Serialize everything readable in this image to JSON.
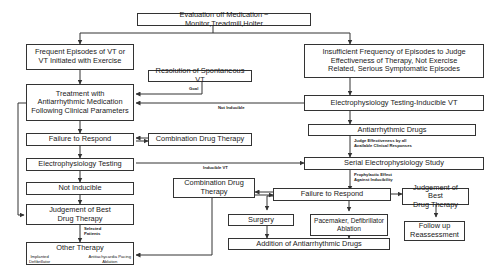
{
  "diagram": {
    "nodes": {
      "evaluation": "Evaluation off Medication ~ Monitor,Treadmill,Holter",
      "frequent_episodes": [
        "Frequent Episodes of VT or",
        "VT Initiated with Exercise"
      ],
      "insufficient_frequency": [
        "Insufficient Frequency of Episodes to Judge",
        "Effectiveness of Therapy, Not Exercise",
        "Related, Serious Symptomatic Episodes"
      ],
      "resolution_spontaneous_vt": "Resolution of Spontaneous VT",
      "treatment_antiarrhythmic": [
        "Treatment with",
        "Antiarrhythmic Medication",
        "Following Clinical Parameters"
      ],
      "ep_testing_inducible": "Electrophysiology Testing-Inducible VT",
      "failure_left": "Failure to Respond",
      "combination_left": "Combination Drug Therapy",
      "antiarrhythmic_drugs": "Antiarrhythmic Drugs",
      "ep_testing_left": "Electrophysiology Testing",
      "serial_ep_study": "Serial Electrophysiology Study",
      "not_inducible": "Not Inducible",
      "combination_mid": [
        "Combination Drug",
        "Therapy"
      ],
      "failure_right": "Failure to Respond",
      "judgement_left": [
        "Judgement of Best",
        "Drug Therapy"
      ],
      "judgement_right": [
        "Judgement of Best",
        "Drug Therapy"
      ],
      "surgery": "Surgery",
      "pacemaker": [
        "Pacemaker, Defibrillator",
        "Ablation"
      ],
      "follow_up": [
        "Follow up",
        "Reassessment"
      ],
      "other_therapy": {
        "title": "Other Therapy",
        "left": [
          "Implanted",
          "Defibrillator"
        ],
        "right": [
          "Antitachycardia Pacing",
          "Ablation"
        ]
      },
      "addition_drugs": "Addition of Antiarrhythmic Drugs"
    },
    "edge_labels": {
      "goal": "Goal",
      "not_inducible": "Not Inducible",
      "judge_effectiveness": [
        "Judge Effectiveness by all",
        "Available Clinical Responses"
      ],
      "inducible_vt": "Inducible VT",
      "prophylactic": [
        "Prophylactic Effect",
        "Against Inducibility"
      ],
      "selected_patients": [
        "Selected",
        "Patients"
      ]
    }
  }
}
